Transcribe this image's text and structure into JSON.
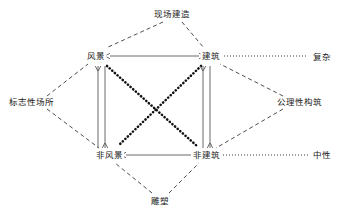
{
  "diagram": {
    "type": "semiotic-square",
    "width": 344,
    "height": 215,
    "background_color": "#ffffff",
    "ink_color": "#3a3a3a",
    "text_color": "#1a1a1a",
    "nodes": [
      {
        "id": "landscape",
        "label": "风景",
        "x": 96,
        "y": 56
      },
      {
        "id": "architecture",
        "label": "建筑",
        "x": 211,
        "y": 56
      },
      {
        "id": "non-landscape",
        "label": "非风景",
        "x": 109,
        "y": 155
      },
      {
        "id": "non-architecture",
        "label": "非建筑",
        "x": 206,
        "y": 155
      }
    ],
    "vertices": [
      {
        "id": "on-site-construction",
        "label": "现场建造",
        "x": 172,
        "y": 14
      },
      {
        "id": "landmark-place",
        "label": "标志性场所",
        "x": 31,
        "y": 102
      },
      {
        "id": "axiomatic-structure",
        "label": "公理性构筑",
        "x": 299,
        "y": 102
      },
      {
        "id": "sculpture",
        "label": "雕塑",
        "x": 160,
        "y": 201
      }
    ],
    "axis_labels": [
      {
        "id": "complex",
        "label": "复杂",
        "x": 322,
        "y": 57
      },
      {
        "id": "neutral",
        "label": "中性",
        "x": 322,
        "y": 155
      }
    ],
    "edges": {
      "dashed_diamond": [
        {
          "from": "on-site-construction",
          "to": "landscape"
        },
        {
          "from": "on-site-construction",
          "to": "architecture"
        },
        {
          "from": "landmark-place",
          "to": "landscape"
        },
        {
          "from": "landmark-place",
          "to": "non-landscape"
        },
        {
          "from": "axiomatic-structure",
          "to": "architecture"
        },
        {
          "from": "axiomatic-structure",
          "to": "non-architecture"
        },
        {
          "from": "sculpture",
          "to": "non-landscape"
        },
        {
          "from": "sculpture",
          "to": "non-architecture"
        }
      ],
      "solid_double_arrows": [
        {
          "from": "landscape",
          "to": "architecture",
          "orientation": "horizontal"
        },
        {
          "from": "non-landscape",
          "to": "non-architecture",
          "orientation": "horizontal"
        },
        {
          "from": "landscape",
          "to": "non-landscape",
          "orientation": "vertical-pair"
        },
        {
          "from": "architecture",
          "to": "non-architecture",
          "orientation": "vertical-pair"
        }
      ],
      "dotted_diagonals": [
        {
          "from": "landscape",
          "to": "non-architecture"
        },
        {
          "from": "architecture",
          "to": "non-landscape"
        }
      ],
      "dotted_axis_lines": [
        {
          "from": "architecture",
          "to": "complex"
        },
        {
          "from": "non-architecture",
          "to": "neutral"
        }
      ]
    }
  }
}
